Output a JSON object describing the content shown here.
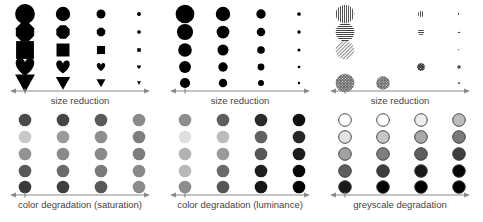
{
  "panels": [
    {
      "id": "shape-size",
      "label": "size reduction",
      "kind": "shapes",
      "rows": [
        "circle",
        "octagon",
        "square",
        "heart",
        "triangle-down"
      ],
      "sizes": [
        11,
        8,
        5,
        2.2
      ],
      "color": "#000000"
    },
    {
      "id": "dot-size",
      "label": "size reduction",
      "kind": "dots",
      "sizes": [
        [
          11,
          8.5,
          5.5,
          2.2
        ],
        [
          9.5,
          7.5,
          5,
          2
        ],
        [
          8,
          6.5,
          4.5,
          1.8
        ],
        [
          7,
          5.5,
          4,
          1.6
        ],
        [
          6,
          5,
          3.5,
          1.4
        ]
      ],
      "color": "#000000"
    },
    {
      "id": "texture-size",
      "label": "size reduction",
      "kind": "textures",
      "rows": [
        "vertical-stripes",
        "horizontal-stripes",
        "diagonal-hatch",
        "crosshatch-dark",
        "crosshatch"
      ],
      "cells": [
        [
          11,
          0,
          3.5,
          1.5
        ],
        [
          11,
          0,
          3.5,
          1.5
        ],
        [
          11,
          0,
          0,
          1.5
        ],
        [
          0,
          0,
          4.5,
          2
        ],
        [
          11,
          8,
          0,
          1.5
        ]
      ]
    },
    {
      "id": "saturation",
      "label": "color degradation (saturation)",
      "kind": "colors",
      "colors": [
        [
          "#4a4a4a",
          "#444444",
          "#5a5a5a",
          "#8a8a8a"
        ],
        [
          "#c8c8c8",
          "#9a9a9a",
          "#8e8e8e",
          "#7e7e7e"
        ],
        [
          "#939393",
          "#8a8a8a",
          "#8a8a8a",
          "#7c7c7c"
        ],
        [
          "#585858",
          "#6a6a6a",
          "#7a7a7a",
          "#8a8a8a"
        ],
        [
          "#3a3a3a",
          "#3e3e3e",
          "#585858",
          "#8c8c8c"
        ]
      ],
      "outline": false
    },
    {
      "id": "luminance",
      "label": "color degradation (luminance)",
      "kind": "colors",
      "colors": [
        [
          "#8e8e8e",
          "#5e5e5e",
          "#2a2a2a",
          "#0e0e0e"
        ],
        [
          "#e0e0e0",
          "#bcbcbc",
          "#616161",
          "#262626"
        ],
        [
          "#b2b2b2",
          "#9a9a9a",
          "#575757",
          "#1c1c1c"
        ],
        [
          "#b8b8b8",
          "#6a6a6a",
          "#1e1e1e",
          "#070707"
        ],
        [
          "#8c8c8c",
          "#555555",
          "#161616",
          "#020202"
        ]
      ],
      "outline": false
    },
    {
      "id": "greyscale",
      "label": "greyscale degradation",
      "kind": "colors",
      "colors": [
        [
          "#ffffff",
          "#ffffff",
          "#ececec",
          "#bdbdbd"
        ],
        [
          "#e4e4e4",
          "#c6c6c6",
          "#a8a8a8",
          "#7a7a7a"
        ],
        [
          "#a2a2a2",
          "#7e7e7e",
          "#5e5e5e",
          "#3e3e3e"
        ],
        [
          "#5e5e5e",
          "#3e3e3e",
          "#1a1a1a",
          "#060606"
        ],
        [
          "#1a1a1a",
          "#050505",
          "#000000",
          "#000000"
        ]
      ],
      "outline": true
    }
  ],
  "axis": {
    "color": "#8a8a8a",
    "arrow_direction": "right"
  },
  "layout": {
    "columns_x": [
      25,
      63,
      101,
      139
    ],
    "top_rows_y": [
      14,
      32,
      50,
      67,
      83
    ],
    "bottom_rows_y": [
      9,
      26,
      43,
      60,
      76
    ],
    "top_axis_y": 91,
    "bottom_axis_y": 84
  }
}
